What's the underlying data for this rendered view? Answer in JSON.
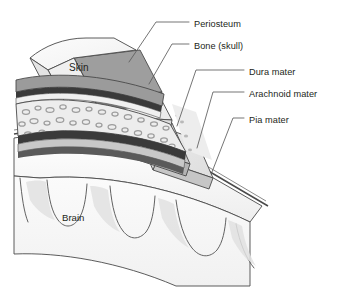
{
  "figure": {
    "background_color": "#ffffff",
    "line_color": "#3b3b3b",
    "text_color": "#231f20"
  },
  "labels": {
    "periosteum": "Periosteum",
    "bone": "Bone (skull)",
    "dura": "Dura mater",
    "arachnoid": "Arachnoid mater",
    "pia": "Pia mater",
    "skin": "Skin",
    "brain": "Brain"
  },
  "layers": [
    {
      "name": "Skin",
      "fill": "#f4f4f4"
    },
    {
      "name": "Periosteum",
      "fill": "#a8a8a8"
    },
    {
      "name": "Bone (skull)",
      "fill": "#efefef"
    },
    {
      "name": "Dura mater",
      "fill": "#d2d2d2"
    },
    {
      "name": "Arachnoid mater",
      "fill": "#e6e6e6"
    },
    {
      "name": "Pia mater",
      "fill": "#f0f0f0"
    },
    {
      "name": "Brain",
      "fill": "#f2f2f2"
    }
  ]
}
